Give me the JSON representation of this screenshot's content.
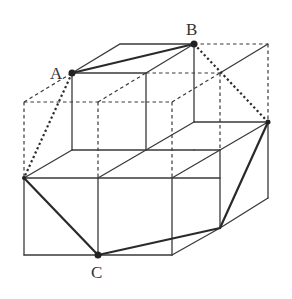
{
  "diagram": {
    "labels": {
      "A": "A",
      "B": "B",
      "C": "C"
    },
    "points": {
      "A": [
        72,
        73
      ],
      "B": [
        194,
        44
      ],
      "C": [
        98,
        255
      ],
      "D": [
        268,
        122
      ],
      "E": [
        24,
        178
      ]
    },
    "highlighted_segments": [
      "A-B",
      "B-D",
      "D-C",
      "C-E",
      "E-A"
    ],
    "colors": {
      "line": "#3a3a3a",
      "highlight": "#2a2a2a",
      "background": "#ffffff"
    }
  }
}
